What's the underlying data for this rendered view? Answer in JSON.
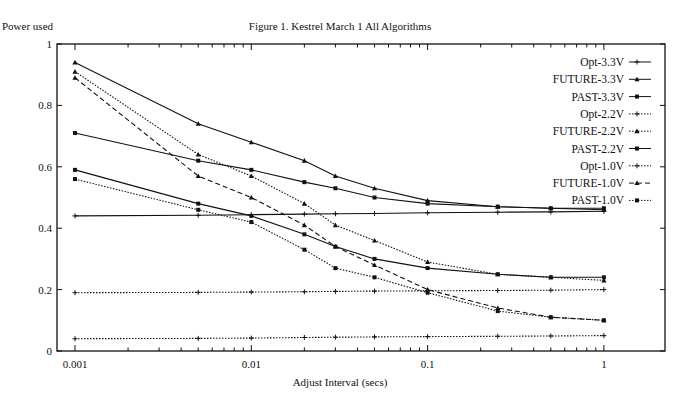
{
  "chart_data": {
    "type": "line",
    "title": "Figure 1. Kestrel March 1 All Algorithms",
    "xlabel": "Adjust Interval (secs)",
    "ylabel": "Power used",
    "xscale": "log",
    "xlim": [
      0.001,
      1
    ],
    "ylim": [
      0,
      1
    ],
    "xticks": [
      "0.001",
      "0.01",
      "0.1",
      "1"
    ],
    "yticks": [
      "0",
      "0.2",
      "0.4",
      "0.6",
      "0.8",
      "1"
    ],
    "grid": false,
    "legend_position": "upper right",
    "x": [
      0.001,
      0.005,
      0.01,
      0.02,
      0.03,
      0.05,
      0.1,
      0.25,
      0.5,
      1
    ],
    "series": [
      {
        "name": "Opt-3.3V",
        "style": "solid",
        "marker": "plus",
        "values": [
          0.44,
          0.442,
          0.444,
          0.446,
          0.447,
          0.448,
          0.45,
          0.452,
          0.453,
          0.455
        ]
      },
      {
        "name": "FUTURE-3.3V",
        "style": "solid",
        "marker": "triangle",
        "values": [
          0.94,
          0.74,
          0.68,
          0.62,
          0.57,
          0.53,
          0.49,
          0.47,
          0.465,
          0.46
        ]
      },
      {
        "name": "PAST-3.3V",
        "style": "solid",
        "marker": "square",
        "values": [
          0.71,
          0.62,
          0.59,
          0.55,
          0.53,
          0.5,
          0.48,
          0.47,
          0.465,
          0.465
        ]
      },
      {
        "name": "Opt-2.2V",
        "style": "dotted",
        "marker": "plus",
        "values": [
          0.19,
          0.191,
          0.192,
          0.193,
          0.194,
          0.195,
          0.196,
          0.197,
          0.198,
          0.2
        ]
      },
      {
        "name": "FUTURE-2.2V",
        "style": "dotted",
        "marker": "triangle",
        "values": [
          0.91,
          0.64,
          0.57,
          0.48,
          0.41,
          0.36,
          0.29,
          0.25,
          0.24,
          0.23
        ]
      },
      {
        "name": "PAST-2.2V",
        "style": "solid",
        "marker": "square",
        "values": [
          0.59,
          0.48,
          0.44,
          0.38,
          0.34,
          0.3,
          0.27,
          0.25,
          0.24,
          0.24
        ]
      },
      {
        "name": "Opt-1.0V",
        "style": "dotted",
        "marker": "plus",
        "values": [
          0.04,
          0.041,
          0.042,
          0.044,
          0.045,
          0.046,
          0.047,
          0.048,
          0.049,
          0.05
        ]
      },
      {
        "name": "FUTURE-1.0V",
        "style": "dashed",
        "marker": "triangle",
        "values": [
          0.89,
          0.57,
          0.5,
          0.41,
          0.34,
          0.28,
          0.2,
          0.14,
          0.11,
          0.1
        ]
      },
      {
        "name": "PAST-1.0V",
        "style": "dotted",
        "marker": "square",
        "values": [
          0.56,
          0.46,
          0.42,
          0.33,
          0.27,
          0.24,
          0.19,
          0.13,
          0.11,
          0.1
        ]
      }
    ]
  },
  "colors": {
    "ink": "#111111",
    "background": "#ffffff"
  }
}
